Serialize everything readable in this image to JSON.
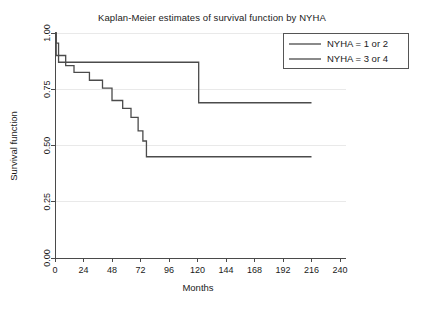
{
  "chart_data": {
    "type": "line",
    "title": "Kaplan-Meier estimates of survival function by NYHA",
    "xlabel": "Months",
    "ylabel": "Survival function",
    "xlim": [
      0,
      240
    ],
    "ylim": [
      0,
      1.0
    ],
    "xticks": [
      0,
      24,
      48,
      72,
      96,
      120,
      144,
      168,
      192,
      216,
      240
    ],
    "xtick_labels": [
      "0",
      "24",
      "48",
      "72",
      "96",
      "120",
      "144",
      "168",
      "192",
      "216",
      "240"
    ],
    "yticks": [
      0.0,
      0.25,
      0.5,
      0.75,
      1.0
    ],
    "ytick_labels": [
      "0.00",
      "0.25",
      "0.50",
      "0.75",
      "1.00"
    ],
    "grid": true,
    "grid_axis": "y",
    "legend_position": "top-right",
    "step_shape": "post",
    "series": [
      {
        "name": "NYHA = 1 or 2",
        "color": "#4b4b4b",
        "points": [
          [
            0,
            1.0
          ],
          [
            1,
            0.955
          ],
          [
            3,
            0.87
          ],
          [
            120,
            0.87
          ],
          [
            121,
            0.69
          ],
          [
            216,
            0.69
          ]
        ]
      },
      {
        "name": "NYHA = 3 or 4",
        "color": "#4b4b4b",
        "points": [
          [
            0,
            1.0
          ],
          [
            1,
            0.9
          ],
          [
            7,
            0.9
          ],
          [
            9,
            0.855
          ],
          [
            13,
            0.855
          ],
          [
            16,
            0.825
          ],
          [
            27,
            0.825
          ],
          [
            29,
            0.79
          ],
          [
            38,
            0.79
          ],
          [
            40,
            0.755
          ],
          [
            46,
            0.755
          ],
          [
            48,
            0.7
          ],
          [
            55,
            0.7
          ],
          [
            57,
            0.665
          ],
          [
            62,
            0.665
          ],
          [
            64,
            0.625
          ],
          [
            68,
            0.625
          ],
          [
            70,
            0.565
          ],
          [
            73,
            0.565
          ],
          [
            74,
            0.52
          ],
          [
            76,
            0.52
          ],
          [
            77,
            0.45
          ],
          [
            216,
            0.45
          ]
        ]
      }
    ]
  },
  "legend": {
    "entries": [
      {
        "label": "NYHA = 1 or 2"
      },
      {
        "label": "NYHA = 3 or 4"
      }
    ]
  }
}
